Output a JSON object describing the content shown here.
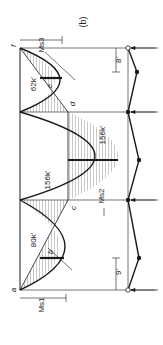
{
  "figure": {
    "panel_label": "(b)",
    "point_labels": {
      "a": "a",
      "b": "b",
      "c": "c",
      "d": "d",
      "e": "e",
      "f": "f"
    },
    "moment_values": {
      "span1": "80k'",
      "span2_left": "156k'",
      "span2_right": "156k'",
      "span3": "62k'"
    },
    "moment_labels": {
      "span1": "Ms1",
      "span2": "Ms2",
      "span3": "Ms3"
    },
    "dimensions": {
      "bottom": "9'",
      "top": "8'"
    },
    "colors": {
      "ink": "#1a1a1a",
      "background": "#ffffff"
    }
  }
}
